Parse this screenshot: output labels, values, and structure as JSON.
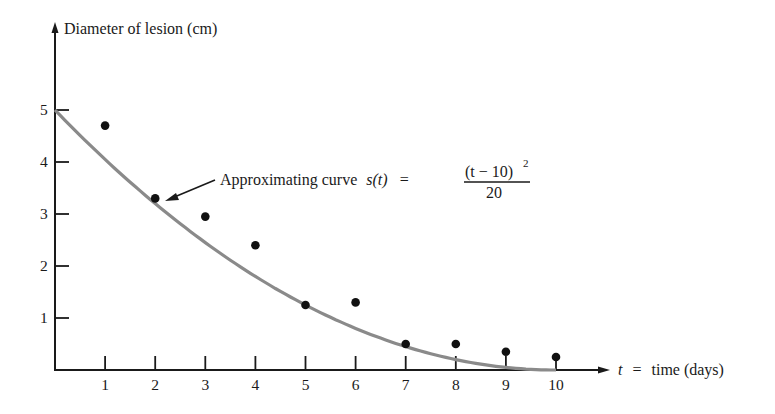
{
  "chart_data": {
    "type": "scatter",
    "title": "",
    "xlabel": "t = time (days)",
    "ylabel": "Diameter of lesion (cm)",
    "xlim": [
      0,
      11
    ],
    "ylim": [
      0,
      5.5
    ],
    "grid": false,
    "legend": null,
    "x_ticks": [
      "1",
      "2",
      "3",
      "4",
      "5",
      "6",
      "7",
      "8",
      "9",
      "10"
    ],
    "y_ticks": [
      "1",
      "2",
      "3",
      "4",
      "5"
    ],
    "series": [
      {
        "name": "Observed diameter",
        "kind": "scatter",
        "x": [
          1,
          2,
          3,
          4,
          5,
          6,
          7,
          8,
          9,
          10
        ],
        "y": [
          4.7,
          3.3,
          2.95,
          2.4,
          1.25,
          1.3,
          0.5,
          0.5,
          0.35,
          0.25
        ]
      },
      {
        "name": "Approximating curve s(t) = (t − 10)^2 / 20",
        "kind": "line",
        "formula": "(t - 10)^2 / 20",
        "x": [
          0,
          1,
          2,
          3,
          4,
          5,
          6,
          7,
          8,
          9,
          10
        ],
        "y": [
          5,
          4.05,
          3.2,
          2.45,
          1.8,
          1.25,
          0.8,
          0.45,
          0.2,
          0.05,
          0
        ]
      }
    ],
    "annotations": [
      {
        "text": "Approximating curve s(t) = (t − 10)^2 / 20",
        "points_to": {
          "x": 2.3,
          "y": 2.9
        }
      }
    ]
  },
  "labels": {
    "y_axis": "Diameter of lesion (cm)",
    "x_axis_var": "t",
    "x_axis_eq": "=",
    "x_axis_text": "time (days)",
    "annotation_prefix": "Approximating curve",
    "annotation_fn": "s(t)",
    "annotation_eq": "=",
    "formula_numerator": "(t − 10)",
    "formula_exponent": "2",
    "formula_denominator": "20"
  }
}
